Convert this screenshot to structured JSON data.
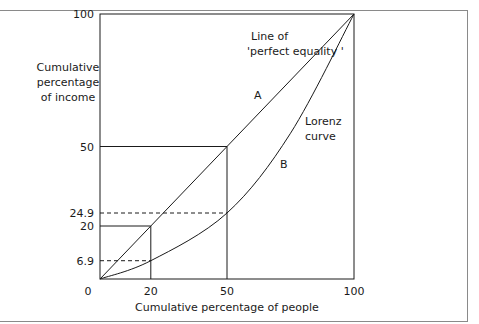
{
  "chart_data": {
    "type": "line",
    "title": "",
    "xlabel": "Cumulative percentage of people",
    "ylabel_lines": [
      "Cumulative",
      "percentage",
      "of income"
    ],
    "xlim": [
      0,
      100
    ],
    "ylim": [
      0,
      100
    ],
    "x_ticks": [
      "0",
      "20",
      "50",
      "100"
    ],
    "x_tick_values": [
      0,
      20,
      50,
      100
    ],
    "y_ticks": [
      "100",
      "50",
      "24.9",
      "20",
      "6.9"
    ],
    "y_tick_values": [
      100,
      50,
      24.9,
      20,
      6.9
    ],
    "grid": false,
    "series": [
      {
        "name": "Line of 'perfect equality'",
        "x": [
          0,
          100
        ],
        "y": [
          0,
          100
        ]
      },
      {
        "name": "Lorenz curve",
        "x": [
          0,
          20,
          50,
          75,
          100
        ],
        "y": [
          0,
          6.9,
          24.9,
          55,
          100
        ]
      }
    ],
    "reference_lines": [
      {
        "name": "perfect-equality-20",
        "x": 20,
        "y": 20,
        "style": "solid"
      },
      {
        "name": "perfect-equality-50",
        "x": 50,
        "y": 50,
        "style": "solid"
      },
      {
        "name": "lorenz-20",
        "x": 20,
        "y": 6.9,
        "style": "dashed"
      },
      {
        "name": "lorenz-50",
        "x": 50,
        "y": 24.9,
        "style": "dashed"
      }
    ],
    "annotations": {
      "equality_line_label": [
        "Line of",
        "'perfect equality '"
      ],
      "area_a": "A",
      "lorenz_label": [
        "Lorenz",
        "curve"
      ],
      "area_b": "B"
    }
  }
}
